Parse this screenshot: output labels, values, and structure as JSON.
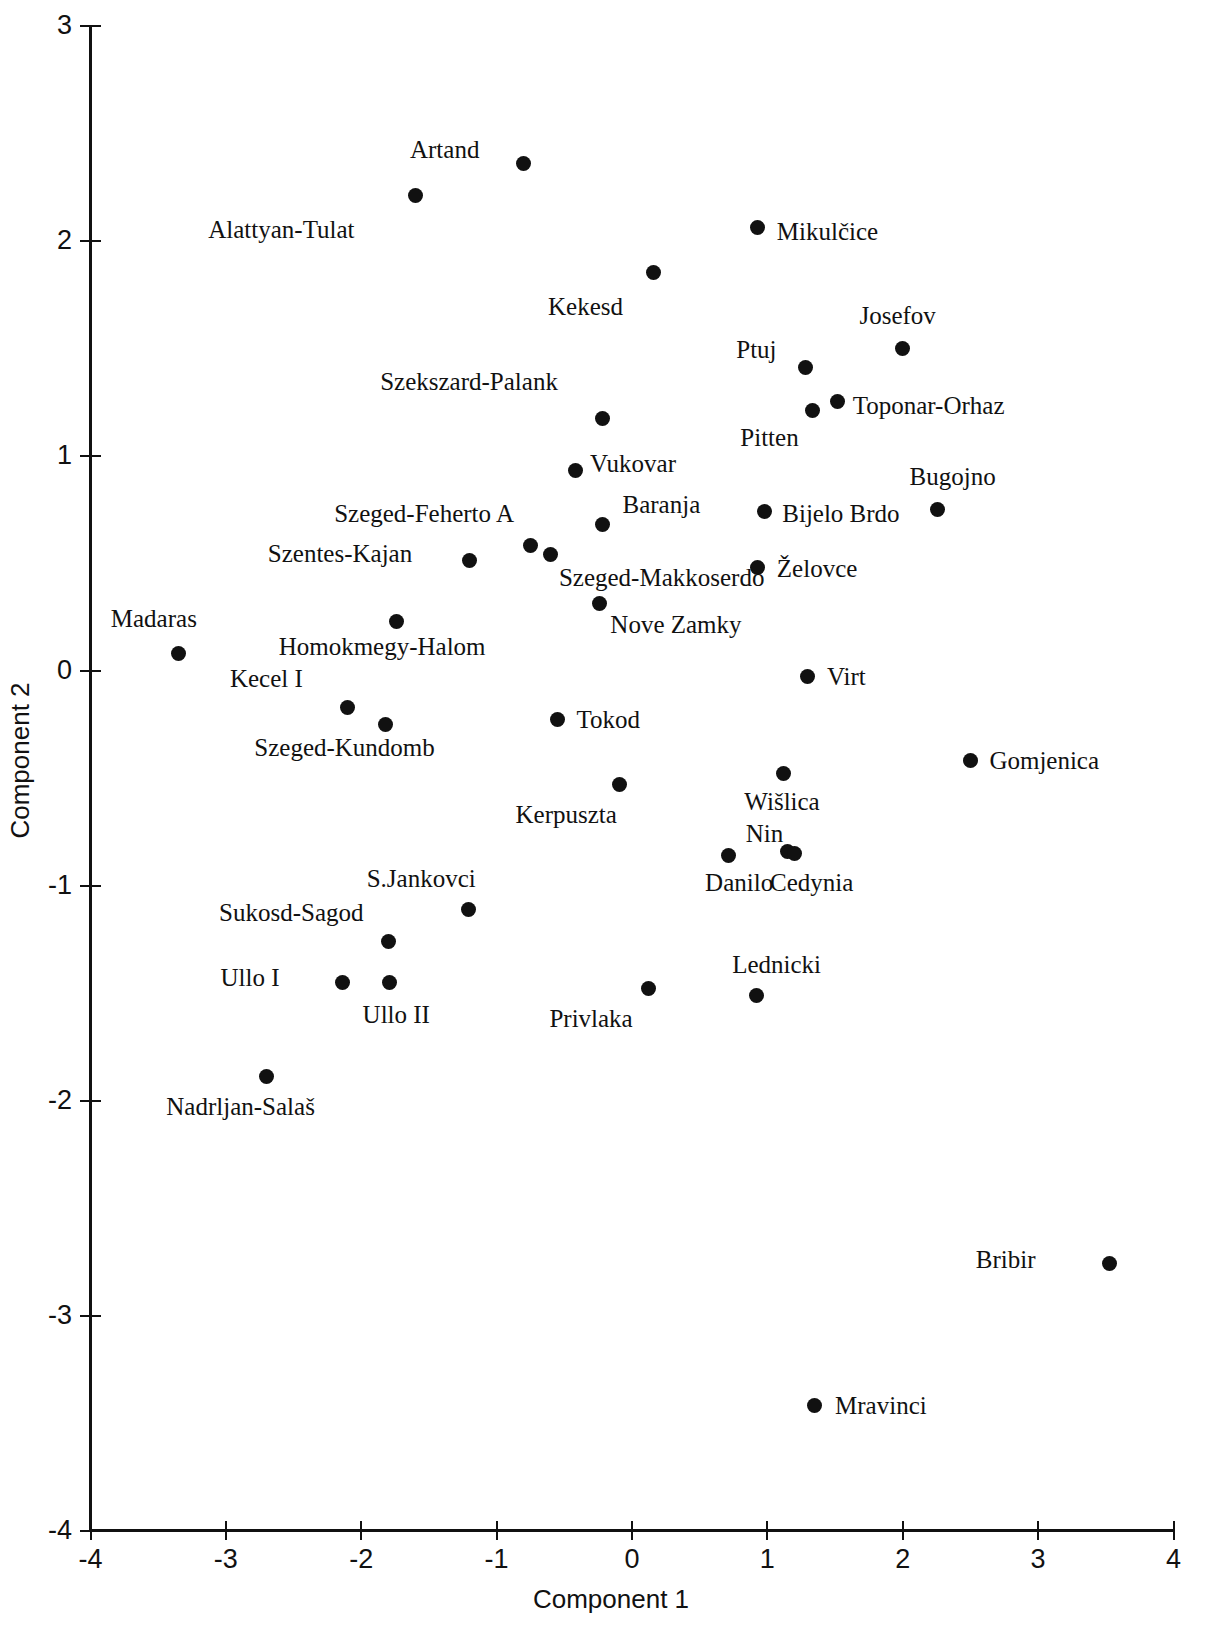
{
  "chart_data": {
    "type": "scatter",
    "title": "",
    "xlabel": "Component 1",
    "ylabel": "Component 2",
    "xlim": [
      -4,
      4
    ],
    "ylim": [
      -4,
      3
    ],
    "xticks": [
      -4,
      -3,
      -2,
      -1,
      0,
      1,
      2,
      3,
      4
    ],
    "yticks": [
      3,
      2,
      1,
      0,
      -1,
      -2,
      -3,
      -4
    ],
    "xtick_labels": [
      "-4",
      "-3",
      "-2",
      "-1",
      "0",
      "1",
      "2",
      "3",
      "4"
    ],
    "ytick_labels": [
      "3",
      "2",
      "1",
      "0",
      "-1",
      "-2",
      "-3",
      "-4"
    ],
    "grid": false,
    "legend": null,
    "marker": "filled-circle",
    "marker_color": "#111111",
    "points": [
      {
        "label": "Artand",
        "x": -0.8,
        "y": 2.36,
        "lx": -1.64,
        "ly": 2.42
      },
      {
        "label": "Alattyan-Tulat",
        "x": -1.6,
        "y": 2.21,
        "lx": -3.13,
        "ly": 2.05
      },
      {
        "label": "Mikulčice",
        "x": 0.93,
        "y": 2.06,
        "lx": 1.07,
        "ly": 2.04
      },
      {
        "label": "Kekesd",
        "x": 0.16,
        "y": 1.85,
        "lx": -0.62,
        "ly": 1.69
      },
      {
        "label": "Josefov",
        "x": 2.0,
        "y": 1.5,
        "lx": 1.68,
        "ly": 1.65
      },
      {
        "label": "Ptuj",
        "x": 1.28,
        "y": 1.41,
        "lx": 0.77,
        "ly": 1.49
      },
      {
        "label": "Szekszard-Palank",
        "x": -0.22,
        "y": 1.17,
        "lx": -1.86,
        "ly": 1.34
      },
      {
        "label": "Toponar-Orhaz",
        "x": 1.52,
        "y": 1.25,
        "lx": 1.63,
        "ly": 1.23
      },
      {
        "label": "Pitten",
        "x": 1.33,
        "y": 1.21,
        "lx": 0.8,
        "ly": 1.08
      },
      {
        "label": "Vukovar",
        "x": -0.42,
        "y": 0.93,
        "lx": -0.31,
        "ly": 0.96
      },
      {
        "label": "Bugojno",
        "x": 2.26,
        "y": 0.75,
        "lx": 2.05,
        "ly": 0.9
      },
      {
        "label": "Baranja",
        "x": -0.22,
        "y": 0.68,
        "lx": -0.07,
        "ly": 0.77
      },
      {
        "label": "Bijelo Brdo",
        "x": 0.98,
        "y": 0.74,
        "lx": 1.11,
        "ly": 0.73
      },
      {
        "label": "Szeged-Feherto A",
        "x": -0.75,
        "y": 0.58,
        "lx": -2.2,
        "ly": 0.73
      },
      {
        "label": "Szentes-Kajan",
        "x": -1.2,
        "y": 0.51,
        "lx": -2.69,
        "ly": 0.54
      },
      {
        "label": "Szeged-Makkoserdo",
        "x": -0.6,
        "y": 0.54,
        "lx": -0.54,
        "ly": 0.43
      },
      {
        "label": "Želovce",
        "x": 0.93,
        "y": 0.48,
        "lx": 1.07,
        "ly": 0.47
      },
      {
        "label": "Nove Zamky",
        "x": -0.24,
        "y": 0.31,
        "lx": -0.16,
        "ly": 0.21
      },
      {
        "label": "Homokmegy-Halom",
        "x": -1.74,
        "y": 0.23,
        "lx": -2.61,
        "ly": 0.11
      },
      {
        "label": "Madaras",
        "x": -3.35,
        "y": 0.08,
        "lx": -3.85,
        "ly": 0.24
      },
      {
        "label": "Virt",
        "x": 1.3,
        "y": -0.03,
        "lx": 1.44,
        "ly": -0.03
      },
      {
        "label": "Kecel I",
        "x": -2.1,
        "y": -0.17,
        "lx": -2.97,
        "ly": -0.04
      },
      {
        "label": "Szeged-Kundomb",
        "x": -1.82,
        "y": -0.25,
        "lx": -2.79,
        "ly": -0.36
      },
      {
        "label": "Tokod",
        "x": -0.55,
        "y": -0.23,
        "lx": -0.41,
        "ly": -0.23
      },
      {
        "label": "Wišlica",
        "x": 1.12,
        "y": -0.48,
        "lx": 0.83,
        "ly": -0.61
      },
      {
        "label": "Gomjenica",
        "x": 2.5,
        "y": -0.42,
        "lx": 2.64,
        "ly": -0.42
      },
      {
        "label": "Kerpuszta",
        "x": -0.09,
        "y": -0.53,
        "lx": -0.86,
        "ly": -0.67
      },
      {
        "label": "Nin",
        "x": 1.15,
        "y": -0.84,
        "lx": 0.84,
        "ly": -0.76
      },
      {
        "label": "Danilo",
        "x": 0.71,
        "y": -0.86,
        "lx": 0.54,
        "ly": -0.99
      },
      {
        "label": "Cedynia",
        "x": 1.2,
        "y": -0.85,
        "lx": 1.02,
        "ly": -0.99
      },
      {
        "label": "S.Jankovci",
        "x": -1.21,
        "y": -1.11,
        "lx": -1.96,
        "ly": -0.97
      },
      {
        "label": "Sukosd-Sagod",
        "x": -1.8,
        "y": -1.26,
        "lx": -3.05,
        "ly": -1.13
      },
      {
        "label": "Lednicki",
        "x": 0.92,
        "y": -1.51,
        "lx": 0.74,
        "ly": -1.37
      },
      {
        "label": "Ullo I",
        "x": -2.14,
        "y": -1.45,
        "lx": -3.04,
        "ly": -1.43
      },
      {
        "label": "Ullo II",
        "x": -1.79,
        "y": -1.45,
        "lx": -1.99,
        "ly": -1.6
      },
      {
        "label": "Privlaka",
        "x": 0.12,
        "y": -1.48,
        "lx": -0.61,
        "ly": -1.62
      },
      {
        "label": "Nadrljan-Salaš",
        "x": -2.7,
        "y": -1.89,
        "lx": -3.44,
        "ly": -2.03
      },
      {
        "label": "Bribir",
        "x": 3.53,
        "y": -2.76,
        "lx": 2.54,
        "ly": -2.74
      },
      {
        "label": "Mravinci",
        "x": 1.35,
        "y": -3.42,
        "lx": 1.5,
        "ly": -3.42
      }
    ]
  }
}
